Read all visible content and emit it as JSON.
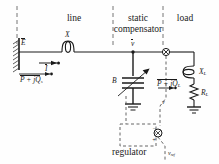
{
  "figure": {
    "type": "single-line-diagram",
    "sections": [
      {
        "id": "line",
        "label": "line"
      },
      {
        "id": "static-compensator",
        "label": "static\ncompensator",
        "line1": "static",
        "line2": "compensator"
      },
      {
        "id": "load",
        "label": "load"
      }
    ],
    "labels": {
      "source_voltage": "E",
      "line_reactance": "X",
      "line_current": "I",
      "source_power": "P + jQ",
      "source_power_sub": "s",
      "bus_voltage": "v",
      "susceptance": "B",
      "load_reactance": "X",
      "load_reactance_sub": "L",
      "load_resistance": "R",
      "load_resistance_sub": "L",
      "load_power": "P + jQ",
      "load_power_sub": "L",
      "regulator": "regulator",
      "reference_voltage": "v",
      "reference_voltage_sub": "ref",
      "summing_plus": "+",
      "summing_minus": "−",
      "feedback_signal": "v"
    },
    "colors": {
      "line": "#1a1a1a",
      "dashed_boundary": "#555555",
      "background": "#ffffff",
      "hatch": "#333333"
    }
  }
}
